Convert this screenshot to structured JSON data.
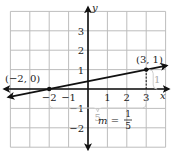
{
  "chart_data": {
    "type": "line",
    "title": "",
    "xlabel": "x",
    "ylabel": "y",
    "xlim": [
      -4,
      4
    ],
    "ylim": [
      -3,
      4
    ],
    "grid": true,
    "x_ticks": [
      "-2",
      "-1",
      "1",
      "2",
      "3"
    ],
    "y_ticks": [
      "3",
      "2",
      "1",
      "-1",
      "-2"
    ],
    "series": [
      {
        "name": "line",
        "x": [
          -4,
          -2,
          3,
          4
        ],
        "y": [
          -0.4,
          0,
          1,
          1.2
        ]
      }
    ],
    "points": [
      {
        "label": "(-2, 0)",
        "x": -2,
        "y": 0
      },
      {
        "label": "(3, 1)",
        "x": 3,
        "y": 1
      }
    ],
    "annotations": {
      "run": "5",
      "rise": "1",
      "slope_prefix": "m =",
      "slope_num": "1",
      "slope_den": "5"
    }
  },
  "colors": {
    "grid": "#bdbdbd",
    "axis": "#111111",
    "annotation": "#aaaaaa"
  }
}
